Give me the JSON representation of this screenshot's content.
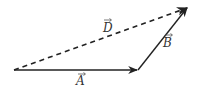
{
  "diagram": {
    "title": "",
    "vectors": [
      {
        "id": "A",
        "label": "A",
        "style": "solid",
        "from": [
          14,
          70
        ],
        "to": [
          138,
          70
        ]
      },
      {
        "id": "B",
        "label": "B",
        "style": "solid",
        "from": [
          138,
          70
        ],
        "to": [
          188,
          7
        ]
      },
      {
        "id": "D",
        "label": "D",
        "style": "dashed",
        "from": [
          14,
          70
        ],
        "to": [
          188,
          7
        ]
      }
    ],
    "labels": {
      "A": "A",
      "B": "B",
      "D": "D"
    },
    "colors": {
      "line": "#222222",
      "background": "#ffffff"
    }
  }
}
